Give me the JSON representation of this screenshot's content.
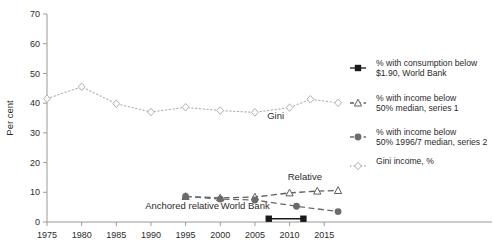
{
  "chart_data": {
    "type": "line",
    "title": "",
    "xlabel": "",
    "ylabel": "Per cent",
    "xlim": [
      1975,
      2018
    ],
    "ylim": [
      0,
      70
    ],
    "ytick_step": 10,
    "xtick_step": 5,
    "grid": false,
    "legend_position": "right",
    "xticks": [
      "1975",
      "1980",
      "1985",
      "1990",
      "1995",
      "2000",
      "2005",
      "2010",
      "2015"
    ],
    "yticks": [
      "0",
      "10",
      "20",
      "30",
      "40",
      "50",
      "60",
      "70"
    ],
    "series": [
      {
        "name": "% with consumption below $1.90, World Bank",
        "key": "world_bank",
        "marker": "filled-square",
        "linestyle": "solid",
        "color": "#1a1a1a",
        "x": [
          2007,
          2012
        ],
        "values": [
          1.1,
          1.1
        ]
      },
      {
        "name": "% with income below 50% median, series 1",
        "key": "relative_series1",
        "marker": "open-triangle",
        "linestyle": "dashed",
        "color": "#5e5e5e",
        "x": [
          1995,
          2000,
          2005,
          2010,
          2014,
          2017
        ],
        "values": [
          8.6,
          8.1,
          8.4,
          9.8,
          10.4,
          10.6
        ]
      },
      {
        "name": "% with income below 50% 1996/7 median, series 2",
        "key": "anchored_series2",
        "marker": "filled-circle",
        "linestyle": "dashed",
        "color": "#6b6b6b",
        "x": [
          1995,
          2000,
          2005,
          2011,
          2017
        ],
        "values": [
          8.6,
          7.7,
          7.4,
          5.3,
          3.5
        ]
      },
      {
        "name": "Gini income, %",
        "key": "gini",
        "marker": "open-diamond",
        "linestyle": "dotted",
        "color": "#b0b0b0",
        "x": [
          1975,
          1980,
          1985,
          1990,
          1995,
          2000,
          2005,
          2010,
          2013,
          2017
        ],
        "values": [
          41.5,
          45.5,
          39.8,
          37.0,
          38.6,
          37.5,
          36.9,
          38.5,
          41.3,
          40.1
        ]
      }
    ],
    "annotations": [
      {
        "key": "gini_label",
        "text": "Gini",
        "x": 2008,
        "y": 34.5
      },
      {
        "key": "anchored_label",
        "text": "Anchored relative",
        "x": 1994.5,
        "y": 4.3
      },
      {
        "key": "world_bank_label",
        "text": "World Bank",
        "x": 2003.6,
        "y": 4.3
      },
      {
        "key": "relative_label",
        "text": "Relative",
        "x": 2012.2,
        "y": 14.0
      }
    ]
  },
  "legend": {
    "entries": [
      {
        "marker": "filled-square",
        "line1": "% with consumption below",
        "line2": "$1.90, World Bank"
      },
      {
        "marker": "open-triangle",
        "line1": "% with income below",
        "line2": "50% median, series 1"
      },
      {
        "marker": "filled-circle",
        "line1": "% with income below",
        "line2": "50% 1996/7 median, series 2"
      },
      {
        "marker": "open-diamond",
        "line1": "Gini income, %",
        "line2": ""
      }
    ]
  },
  "colors": {
    "axis": "#9a9a9a",
    "text": "#2b2b2b",
    "world_bank": "#1a1a1a",
    "series1": "#5e5e5e",
    "series2": "#6b6b6b",
    "gini": "#b0b0b0"
  }
}
